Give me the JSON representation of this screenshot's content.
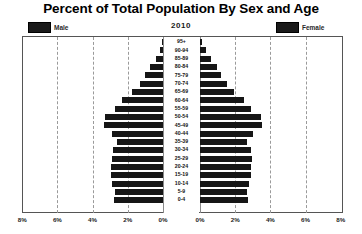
{
  "title": "Percent of Total Population By Sex and Age",
  "year": "2010",
  "legend": {
    "male": "Male",
    "female": "Female"
  },
  "axis": {
    "left_ticks": [
      "8%",
      "6%",
      "4%",
      "2%",
      "0%"
    ],
    "right_ticks": [
      "0%",
      "2%",
      "4%",
      "6%",
      "8%"
    ]
  },
  "colors": {
    "bar": "#161616",
    "frame": "#555555",
    "grid": "#9a9a9a",
    "background": "#ffffff"
  },
  "chart_data": {
    "type": "bar",
    "title": "Percent of Total Population By Sex and Age",
    "subtitle": "2010",
    "xlabel": "",
    "ylabel": "",
    "xlim": [
      0,
      8
    ],
    "grid": true,
    "legend_position": "top",
    "orientation": "population-pyramid",
    "categories": [
      "95+",
      "90-94",
      "85-89",
      "80-84",
      "75-79",
      "70-74",
      "65-69",
      "60-64",
      "55-59",
      "50-54",
      "45-49",
      "40-44",
      "35-39",
      "30-34",
      "25-29",
      "20-24",
      "15-19",
      "10-14",
      "5-9",
      "0-4"
    ],
    "series": [
      {
        "name": "Male",
        "values": [
          0.05,
          0.18,
          0.42,
          0.72,
          1.0,
          1.32,
          1.78,
          2.32,
          2.75,
          3.3,
          3.38,
          2.92,
          2.6,
          2.82,
          2.92,
          2.95,
          2.95,
          2.88,
          2.72,
          2.78
        ]
      },
      {
        "name": "Female",
        "values": [
          0.12,
          0.32,
          0.62,
          0.98,
          1.22,
          1.52,
          1.95,
          2.48,
          2.88,
          3.45,
          3.5,
          3.02,
          2.68,
          2.88,
          2.95,
          2.92,
          2.88,
          2.8,
          2.66,
          2.7
        ]
      }
    ]
  }
}
